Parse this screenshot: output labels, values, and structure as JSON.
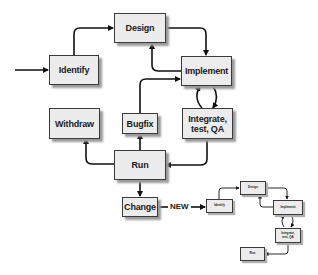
{
  "main_diagram": {
    "nodes": {
      "design": "Design",
      "identify": "Identify",
      "implement": "Implement",
      "integrate": "Integrate,\ntest, QA",
      "withdraw": "Withdraw",
      "bugfix": "Bugfix",
      "run": "Run",
      "change": "Change"
    },
    "edges": [
      {
        "from": "entry",
        "to": "identify"
      },
      {
        "from": "identify",
        "to": "design"
      },
      {
        "from": "design",
        "to": "implement"
      },
      {
        "from": "implement",
        "to": "design"
      },
      {
        "from": "implement",
        "to": "integrate"
      },
      {
        "from": "integrate",
        "to": "implement"
      },
      {
        "from": "integrate",
        "to": "run"
      },
      {
        "from": "run",
        "to": "withdraw"
      },
      {
        "from": "run",
        "to": "bugfix"
      },
      {
        "from": "bugfix",
        "to": "implement"
      },
      {
        "from": "run",
        "to": "change"
      },
      {
        "from": "change",
        "to": "mini_identify",
        "label": "NEW"
      }
    ]
  },
  "connector_label": "NEW",
  "mini_diagram": {
    "nodes": {
      "identify": "Identify",
      "design": "Design",
      "implement": "Implement",
      "integrate": "Integrate,\ntest, QA",
      "run": "Run"
    }
  },
  "colors": {
    "box_fill": "#ececec",
    "box_border": "#3a3a3a",
    "shadow": "#9a9a9a",
    "line": "#111111"
  }
}
